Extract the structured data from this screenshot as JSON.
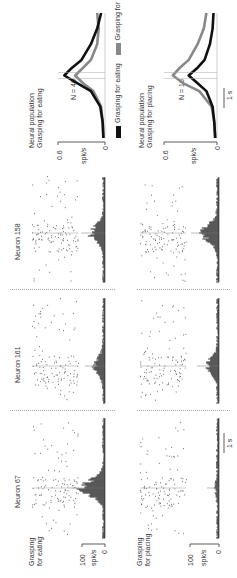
{
  "figure": {
    "row_labels": {
      "eating": [
        "Grasping",
        "for eating"
      ],
      "placing": [
        "Grasping",
        "for placing"
      ]
    },
    "neurons": [
      {
        "label": "Neuron 67"
      },
      {
        "label": "Neuron 161"
      },
      {
        "label": "Neuron 158"
      }
    ],
    "single_axis": {
      "ylabel": "spk/s",
      "ymax": "100",
      "ymin": "0"
    },
    "scale_bar": "1 s",
    "population": {
      "eating": {
        "title": [
          "Neural population",
          "Grasping for eating"
        ],
        "n": "N = 46"
      },
      "placing": {
        "title": [
          "Neural population",
          "Grasping for placing"
        ],
        "n": "N = 16"
      },
      "axis": {
        "ylabel": "spk/s",
        "ymax": "0.6",
        "ymin": "0"
      },
      "legend": [
        {
          "label": "Grasping for eating",
          "color": "#111111"
        },
        {
          "label": "Grasping for placing",
          "color": "#888888"
        }
      ],
      "scale_bar": "1 s"
    }
  },
  "chart_data": [
    {
      "type": "line",
      "title": "Neural population - Grasping for eating",
      "annotation": "N = 46",
      "ylabel": "spk/s",
      "ylim": [
        0,
        0.6
      ],
      "x": [
        -2.0,
        -1.5,
        -1.0,
        -0.5,
        -0.25,
        0.0,
        0.25,
        0.5,
        1.0,
        1.5,
        2.0
      ],
      "series": [
        {
          "name": "Grasping for eating",
          "color": "#111111",
          "values": [
            0.02,
            0.03,
            0.06,
            0.18,
            0.35,
            0.52,
            0.42,
            0.3,
            0.18,
            0.1,
            0.05
          ]
        },
        {
          "name": "Grasping for placing",
          "color": "#888888",
          "values": [
            0.02,
            0.03,
            0.05,
            0.15,
            0.28,
            0.38,
            0.28,
            0.18,
            0.1,
            0.08,
            0.1
          ]
        }
      ]
    },
    {
      "type": "line",
      "title": "Neural population - Grasping for placing",
      "annotation": "N = 16",
      "ylabel": "spk/s",
      "ylim": [
        0,
        0.6
      ],
      "x": [
        -2.0,
        -1.5,
        -1.0,
        -0.5,
        -0.25,
        0.0,
        0.25,
        0.5,
        1.0,
        1.5,
        2.0
      ],
      "series": [
        {
          "name": "Grasping for eating",
          "color": "#111111",
          "values": [
            0.02,
            0.03,
            0.05,
            0.12,
            0.22,
            0.32,
            0.22,
            0.14,
            0.08,
            0.05,
            0.04
          ]
        },
        {
          "name": "Grasping for placing",
          "color": "#888888",
          "values": [
            0.02,
            0.03,
            0.06,
            0.2,
            0.38,
            0.5,
            0.42,
            0.32,
            0.22,
            0.15,
            0.12
          ]
        }
      ]
    }
  ]
}
